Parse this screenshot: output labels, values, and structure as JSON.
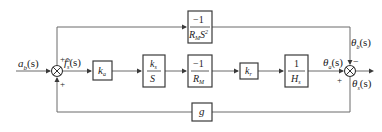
{
  "diagram": {
    "type": "control-system block diagram",
    "signals": {
      "input": {
        "label": "a",
        "sub": "b",
        "arg": "(s)"
      },
      "error": {
        "label": "f",
        "sub": "s",
        "sup": "b",
        "arg": "(s)"
      },
      "theta_a": {
        "label": "θ",
        "sub": "a",
        "arg": "(s)"
      },
      "theta_b": {
        "label": "θ",
        "sub": "b",
        "arg": "(s)"
      },
      "output": {
        "label": "θ",
        "sub": "s",
        "arg": "(s)"
      }
    },
    "summing_junctions": [
      {
        "id": "sum-left",
        "signs": {
          "top": "+",
          "bottom": "+"
        }
      },
      {
        "id": "sum-right",
        "signs": {
          "top": "−",
          "left": "+"
        }
      }
    ],
    "blocks": {
      "ka": {
        "main": "k",
        "sub": "a"
      },
      "ks_over_s": {
        "num": "k",
        "num_sub": "s",
        "den": "S"
      },
      "neg_inv_rm": {
        "num": "−1",
        "den": "R",
        "den_sub": "M"
      },
      "kr": {
        "main": "k",
        "sub": "r"
      },
      "inv_hs": {
        "num": "1",
        "den": "H",
        "den_sub": "s"
      },
      "feedforward": {
        "num": "−1",
        "den": "R",
        "den_sub": "M",
        "den_tail": "S",
        "den_sup": "2"
      },
      "feedback": {
        "main": "g"
      }
    }
  }
}
